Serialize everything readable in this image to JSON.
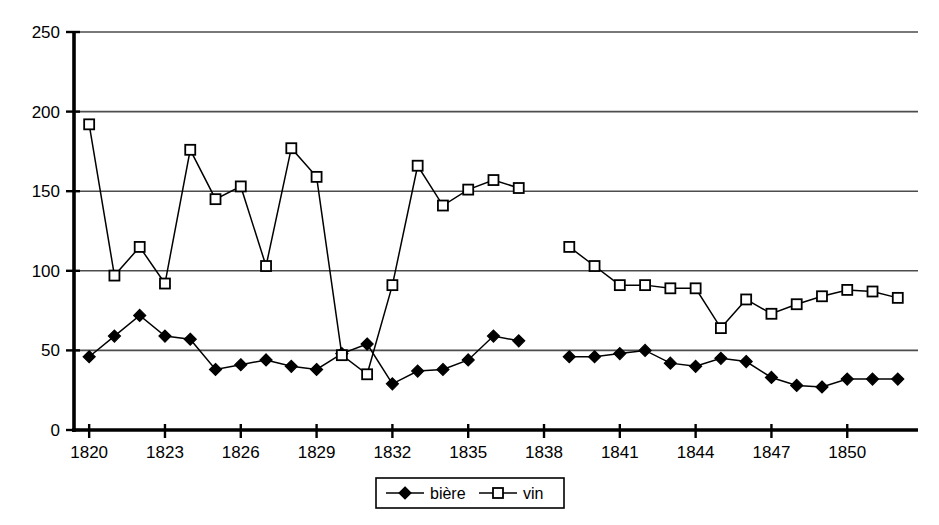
{
  "chart_data": {
    "type": "line",
    "title": "",
    "subtitle": "",
    "xlabel": "",
    "ylabel": "",
    "xlim": [
      1819.4,
      1852.8
    ],
    "ylim": [
      0,
      250
    ],
    "grid": true,
    "legend_position": "bottom",
    "y_ticks": [
      0,
      50,
      100,
      150,
      200,
      250
    ],
    "y_tick_labels": [
      "0",
      "50",
      "100",
      "150",
      "200",
      "250"
    ],
    "x_ticks": [
      1820,
      1823,
      1826,
      1829,
      1832,
      1835,
      1838,
      1841,
      1844,
      1847,
      1850
    ],
    "x_tick_labels": [
      "1820",
      "1823",
      "1826",
      "1829",
      "1832",
      "1835",
      "1838",
      "1841",
      "1844",
      "1847",
      "1850"
    ],
    "x": [
      1820,
      1821,
      1822,
      1823,
      1824,
      1825,
      1826,
      1827,
      1828,
      1829,
      1830,
      1831,
      1832,
      1833,
      1834,
      1835,
      1836,
      1837,
      1839,
      1840,
      1841,
      1842,
      1843,
      1844,
      1845,
      1846,
      1847,
      1848,
      1849,
      1850,
      1851,
      1852
    ],
    "series": [
      {
        "name": "bière",
        "marker": "filled-diamond",
        "color": "#000000",
        "values": [
          46,
          59,
          72,
          59,
          57,
          38,
          41,
          44,
          40,
          38,
          48,
          54,
          29,
          37,
          38,
          44,
          59,
          56,
          46,
          46,
          48,
          50,
          42,
          40,
          45,
          43,
          33,
          28,
          27,
          32,
          32,
          32
        ]
      },
      {
        "name": "vin",
        "marker": "open-square",
        "color": "#000000",
        "values": [
          192,
          97,
          115,
          92,
          176,
          145,
          153,
          103,
          177,
          159,
          47,
          35,
          91,
          166,
          141,
          151,
          157,
          152,
          115,
          103,
          91,
          91,
          89,
          89,
          64,
          82,
          73,
          79,
          84,
          88,
          87,
          83
        ]
      }
    ],
    "gap_after_year": 1837,
    "legend": [
      {
        "label": "bière",
        "marker": "filled-diamond"
      },
      {
        "label": "vin",
        "marker": "open-square"
      }
    ]
  }
}
